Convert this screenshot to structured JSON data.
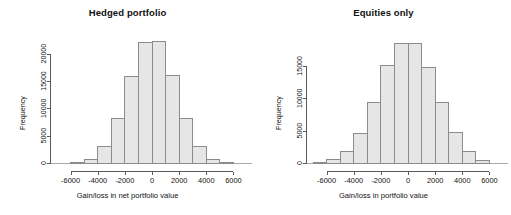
{
  "figure": {
    "width": 511,
    "height": 215,
    "background": "#ffffff",
    "bar_fill": "#e6e6e6",
    "bar_stroke": "#8c8c8c",
    "axis_color": "#5a5a5a",
    "text_color": "#111111"
  },
  "chart_data": [
    {
      "type": "bar",
      "title": "Hedged portfolio",
      "xlabel": "Gain/loss in net portfolio value",
      "ylabel": "Frequency",
      "grid": false,
      "legend": "none",
      "xlim": [
        -7000,
        7000
      ],
      "ylim": [
        0,
        22500
      ],
      "xticks": [
        -6000,
        -4000,
        -2000,
        0,
        2000,
        4000,
        6000
      ],
      "xtick_labels": [
        "-6000",
        "-4000",
        "-2000",
        "0",
        "2000",
        "4000",
        "6000"
      ],
      "yticks": [
        0,
        5000,
        10000,
        15000,
        20000
      ],
      "ytick_labels": [
        "0",
        "5000",
        "10000",
        "15000",
        "20000"
      ],
      "bin_width": 1000,
      "bin_edges": [
        -6000,
        -5000,
        -4000,
        -3000,
        -2000,
        -1000,
        0,
        1000,
        2000,
        3000,
        4000,
        5000,
        6000
      ],
      "categories": [
        "-6000..-5000",
        "-5000..-4000",
        "-4000..-3000",
        "-3000..-2000",
        "-2000..-1000",
        "-1000..0",
        "0..1000",
        "1000..2000",
        "2000..3000",
        "3000..4000",
        "4000..5000",
        "5000..6000"
      ],
      "values": [
        100,
        700,
        3000,
        8100,
        15900,
        22100,
        22200,
        16000,
        8100,
        3000,
        700,
        100
      ]
    },
    {
      "type": "bar",
      "title": "Equities only",
      "xlabel": "Gain/loss in portfolio value",
      "ylabel": "Frequency",
      "grid": false,
      "legend": "none",
      "xlim": [
        -7000,
        7000
      ],
      "ylim": [
        0,
        19000
      ],
      "xticks": [
        -6000,
        -4000,
        -2000,
        0,
        2000,
        4000,
        6000
      ],
      "xtick_labels": [
        "-6000",
        "-4000",
        "-2000",
        "0",
        "2000",
        "4000",
        "6000"
      ],
      "yticks": [
        0,
        5000,
        10000,
        15000
      ],
      "ytick_labels": [
        "0",
        "5000",
        "10000",
        "15000"
      ],
      "bin_width": 1000,
      "bin_edges": [
        -7000,
        -6000,
        -5000,
        -4000,
        -3000,
        -2000,
        -1000,
        0,
        1000,
        2000,
        3000,
        4000,
        5000,
        6000
      ],
      "categories": [
        "-7000..-6000",
        "-6000..-5000",
        "-5000..-4000",
        "-4000..-3000",
        "-3000..-2000",
        "-2000..-1000",
        "-1000..0",
        "0..1000",
        "1000..2000",
        "2000..3000",
        "3000..4000",
        "4000..5000",
        "5000..6000"
      ],
      "values": [
        150,
        600,
        1800,
        4600,
        9400,
        15100,
        18500,
        18400,
        14800,
        9400,
        4700,
        1800,
        450
      ]
    }
  ]
}
